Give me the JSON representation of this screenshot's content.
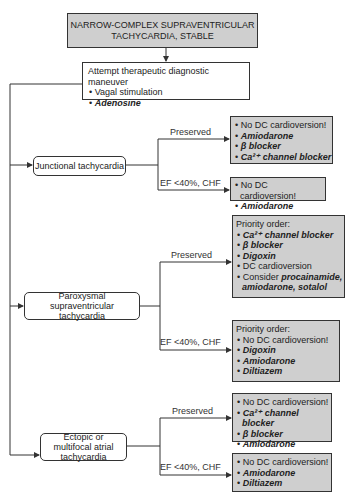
{
  "title": "NARROW-COMPLEX SUPRAVENTRICULAR TACHYCARDIA, STABLE",
  "title_lines": [
    "NARROW-COMPLEX SUPRAVENTRICULAR",
    "TACHYCARDIA, STABLE"
  ],
  "initial_step": {
    "heading": "Attempt therapeutic diagnostic maneuver",
    "items": [
      {
        "text": "Vagal stimulation",
        "drug": false
      },
      {
        "text": "Adenosine",
        "drug": true
      }
    ]
  },
  "branches": [
    {
      "name": "Junctional tachycardia",
      "preserved": {
        "label": "Preserved",
        "heading": "",
        "items": [
          {
            "text": "No DC cardioversion!",
            "drug": false
          },
          {
            "text": "Amiodarone",
            "drug": true
          },
          {
            "text": "β blocker",
            "drug": true
          },
          {
            "text": "Ca²⁺ channel blocker",
            "drug": true
          }
        ]
      },
      "reduced": {
        "label": "EF <40%, CHF",
        "heading": "",
        "items": [
          {
            "text": "No DC cardioversion!",
            "drug": false
          },
          {
            "text": "Amiodarone",
            "drug": true
          }
        ]
      }
    },
    {
      "name": "Paroxysmal supraventricular tachycardia",
      "preserved": {
        "label": "Preserved",
        "heading": "Priority order:",
        "items": [
          {
            "text": "Ca²⁺ channel blocker",
            "drug": true
          },
          {
            "text": "β blocker",
            "drug": true
          },
          {
            "text": "Digoxin",
            "drug": true
          },
          {
            "text": "DC cardioversion",
            "drug": false
          },
          {
            "prefix": "Consider ",
            "text": "procainamide, amiodarone, sotalol",
            "drug": true
          }
        ]
      },
      "reduced": {
        "label": "EF <40%, CHF",
        "heading": "Priority order:",
        "items": [
          {
            "text": "No DC cardioversion!",
            "drug": false
          },
          {
            "text": "Digoxin",
            "drug": true
          },
          {
            "text": "Amiodarone",
            "drug": true
          },
          {
            "text": "Diltiazem",
            "drug": true
          }
        ]
      }
    },
    {
      "name": "Ectopic or multifocal atrial tachycardia",
      "preserved": {
        "label": "Preserved",
        "heading": "",
        "items": [
          {
            "text": "No DC cardioversion!",
            "drug": false
          },
          {
            "text": "Ca²⁺ channel blocker",
            "drug": true
          },
          {
            "text": "β blocker",
            "drug": true
          },
          {
            "text": "Amiodarone",
            "drug": true
          }
        ]
      },
      "reduced": {
        "label": "EF <40%, CHF",
        "heading": "",
        "items": [
          {
            "text": "No DC cardioversion!",
            "drug": false
          },
          {
            "text": "Amiodarone",
            "drug": true
          },
          {
            "text": "Diltiazem",
            "drug": true
          }
        ]
      }
    }
  ],
  "colors": {
    "box_fill": "#cfcfcf",
    "line": "#333333"
  }
}
